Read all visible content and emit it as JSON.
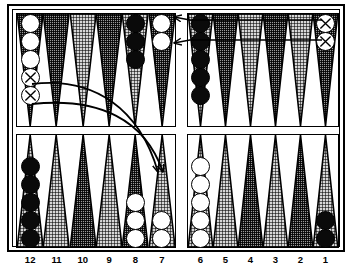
{
  "app": {
    "title": "Backgammon Board Position",
    "board_label": "backgammon-board"
  },
  "board": {
    "point_labels": [
      "12",
      "11",
      "10",
      "9",
      "8",
      "7",
      "6",
      "5",
      "4",
      "3",
      "2",
      "1"
    ],
    "bar_label": "bar",
    "colors": {
      "checker_white": "#ffffff",
      "checker_black": "#0a0a0a",
      "point_dark": "#9a9a9a",
      "point_light": "#d7d7d7",
      "border": "#000000",
      "background": "#ffffff"
    }
  },
  "chart_data": {
    "type": "table",
    "xlabel": "Point number",
    "ylabel": "Checkers on point",
    "categories": [
      "12",
      "11",
      "10",
      "9",
      "8",
      "7",
      "6",
      "5",
      "4",
      "3",
      "2",
      "1"
    ],
    "series": [
      {
        "name": "Top row (outer)",
        "values": [
          5,
          0,
          0,
          0,
          3,
          2,
          5,
          0,
          0,
          0,
          0,
          2
        ]
      },
      {
        "name": "Bottom row (home)",
        "values": [
          5,
          0,
          0,
          0,
          3,
          2,
          5,
          0,
          0,
          0,
          0,
          2
        ]
      }
    ],
    "legend_position": "none",
    "grid": false
  },
  "points": {
    "top": [
      {
        "num": "12",
        "shade": "dark",
        "color": "white",
        "count": 5,
        "marked": 2,
        "marked_from_bottom": true
      },
      {
        "num": "11",
        "shade": "dark",
        "color": "none",
        "count": 0,
        "marked": 0
      },
      {
        "num": "10",
        "shade": "light",
        "color": "none",
        "count": 0,
        "marked": 0
      },
      {
        "num": "9",
        "shade": "dark",
        "color": "none",
        "count": 0,
        "marked": 0
      },
      {
        "num": "8",
        "shade": "light",
        "color": "black",
        "count": 3,
        "marked": 0
      },
      {
        "num": "7",
        "shade": "dark",
        "color": "white",
        "count": 2,
        "marked": 0
      },
      {
        "num": "6",
        "shade": "light",
        "color": "black",
        "count": 5,
        "marked": 0
      },
      {
        "num": "5",
        "shade": "dark",
        "color": "none",
        "count": 0,
        "marked": 0
      },
      {
        "num": "4",
        "shade": "light",
        "color": "none",
        "count": 0,
        "marked": 0
      },
      {
        "num": "3",
        "shade": "dark",
        "color": "none",
        "count": 0,
        "marked": 0
      },
      {
        "num": "2",
        "shade": "light",
        "color": "none",
        "count": 0,
        "marked": 0
      },
      {
        "num": "1",
        "shade": "dark",
        "color": "white",
        "count": 2,
        "marked": 2
      }
    ],
    "bottom": [
      {
        "num": "12",
        "shade": "light",
        "color": "black",
        "count": 5,
        "marked": 0
      },
      {
        "num": "11",
        "shade": "light",
        "color": "none",
        "count": 0,
        "marked": 0
      },
      {
        "num": "10",
        "shade": "dark",
        "color": "none",
        "count": 0,
        "marked": 0
      },
      {
        "num": "9",
        "shade": "light",
        "color": "none",
        "count": 0,
        "marked": 0
      },
      {
        "num": "8",
        "shade": "dark",
        "color": "white",
        "count": 3,
        "marked": 0
      },
      {
        "num": "7",
        "shade": "light",
        "color": "white",
        "count": 2,
        "marked": 0
      },
      {
        "num": "6",
        "shade": "light",
        "color": "white",
        "count": 5,
        "marked": 0
      },
      {
        "num": "5",
        "shade": "light",
        "color": "none",
        "count": 0,
        "marked": 0
      },
      {
        "num": "4",
        "shade": "dark",
        "color": "none",
        "count": 0,
        "marked": 0
      },
      {
        "num": "3",
        "shade": "light",
        "color": "none",
        "count": 0,
        "marked": 0
      },
      {
        "num": "2",
        "shade": "dark",
        "color": "none",
        "count": 0,
        "marked": 0
      },
      {
        "num": "1",
        "shade": "light",
        "color": "black",
        "count": 2,
        "marked": 0
      }
    ]
  },
  "annotations": {
    "straight_arrows": [
      {
        "name": "move-arrow-1-to-7-upper",
        "from_point": "1",
        "to_point": "7",
        "row": "top"
      },
      {
        "name": "move-arrow-1-to-7-lower",
        "from_point": "1",
        "to_point": "7",
        "row": "top"
      }
    ],
    "curved_arrows": [
      {
        "name": "move-arrow-12-to-7-upper",
        "from_point": "12",
        "to_point": "7",
        "from_row": "top",
        "to_row": "bottom"
      },
      {
        "name": "move-arrow-12-to-7-lower",
        "from_point": "12",
        "to_point": "7",
        "from_row": "top",
        "to_row": "bottom"
      }
    ]
  }
}
